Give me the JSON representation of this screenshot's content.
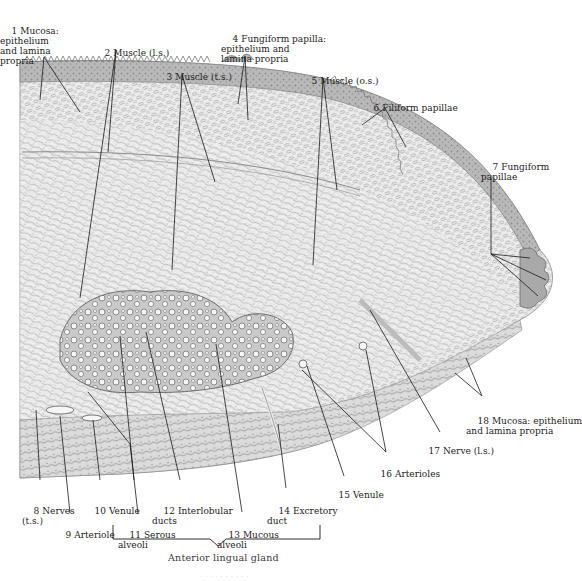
{
  "figure": {
    "caption_bottom": "Anterior lingual gland",
    "faint_footer": "· ·  · · · ·   ·  · ·  ·"
  },
  "labels": [
    {
      "id": 1,
      "num": "1",
      "text": "Mucosa:\nepithelium\nand lamina\npropria",
      "x": 28,
      "y": 16
    },
    {
      "id": 2,
      "num": "2",
      "text": "Muscle (l.s.)",
      "x": 95,
      "y": 38
    },
    {
      "id": 3,
      "num": "3",
      "text": "Muscle (t.s.)",
      "x": 155,
      "y": 62
    },
    {
      "id": 4,
      "num": "4",
      "text": "Fungiform papilla:\nepithelium and\nlamina propria",
      "x": 222,
      "y": 24
    },
    {
      "id": 5,
      "num": "5",
      "text": "Muscle (o.s.)",
      "x": 300,
      "y": 66
    },
    {
      "id": 6,
      "num": "6",
      "text": "Filiform papillae",
      "x": 362,
      "y": 92
    },
    {
      "id": 7,
      "num": "7",
      "text": "Fungiform\npapillae",
      "x": 482,
      "y": 152
    },
    {
      "id": 8,
      "num": "8",
      "text": "Nerves\n(t.s.)",
      "x": 22,
      "y": 496
    },
    {
      "id": 9,
      "num": "9",
      "text": "Arteriole",
      "x": 54,
      "y": 520
    },
    {
      "id": 10,
      "num": "10",
      "text": "Venule",
      "x": 83,
      "y": 496
    },
    {
      "id": 11,
      "num": "11",
      "text": "Serous\nalveoli",
      "x": 118,
      "y": 520
    },
    {
      "id": 12,
      "num": "12",
      "text": "Interlobular\nducts",
      "x": 152,
      "y": 496
    },
    {
      "id": 13,
      "num": "13",
      "text": "Mucous\nalveoli",
      "x": 217,
      "y": 520
    },
    {
      "id": 14,
      "num": "14",
      "text": "Excretory\nduct",
      "x": 267,
      "y": 496
    },
    {
      "id": 15,
      "num": "15",
      "text": "Venule",
      "x": 327,
      "y": 480
    },
    {
      "id": 16,
      "num": "16",
      "text": "Arterioles",
      "x": 369,
      "y": 459
    },
    {
      "id": 17,
      "num": "17",
      "text": "Nerve (l.s.)",
      "x": 417,
      "y": 436
    },
    {
      "id": 18,
      "num": "18",
      "text": "Mucosa: epithelium\nand lamina propria",
      "x": 466,
      "y": 406
    }
  ],
  "bracket": {
    "label": "Anterior lingual gland",
    "x1": 113,
    "x2": 320,
    "y": 539,
    "tip_x": 218
  },
  "colors": {
    "background": "#ffffff",
    "ink": "#1c1c1c",
    "tissue_light": "#e9e9e9",
    "tissue_mid": "#bdbdbd",
    "tissue_dark": "#8a8a8a",
    "epithelium": "#9a9a9a",
    "leader": "#1a1a1a"
  }
}
